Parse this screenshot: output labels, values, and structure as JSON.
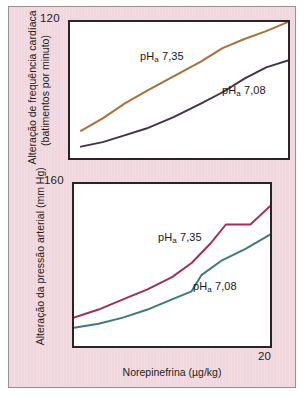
{
  "figure": {
    "background_color": "#efd7dd",
    "border_color": "#9b8d92",
    "panels": [
      {
        "id": "top",
        "y_tick_label": "120",
        "y_axis_title_line1": "Alteração de frequência cardíaca",
        "y_axis_title_line2": "(batimentos por minuto)",
        "series_label_upper": "pH",
        "series_label_upper_sub": "a",
        "series_label_upper_value": " 7,35",
        "series_label_lower": "pH",
        "series_label_lower_sub": "a",
        "series_label_lower_value": " 7,08"
      },
      {
        "id": "bottom",
        "y_tick_label": "160",
        "y_axis_title": "Alteração da pressão arterial (mm Hg)",
        "x_tick_label": "20",
        "x_axis_title": "Norepinefrina (µg/kg)",
        "series_label_upper": "pH",
        "series_label_upper_sub": "a",
        "series_label_upper_value": " 7,35",
        "series_label_lower": "pH",
        "series_label_lower_sub": "a",
        "series_label_lower_value": " 7,08"
      }
    ]
  },
  "chart_data": [
    {
      "type": "line",
      "title": "",
      "panel": "top",
      "xlabel": "Norepinefrina (µg/kg)",
      "ylabel": "Alteração de frequência cardíaca (batimentos por minuto)",
      "xlim": [
        0,
        20
      ],
      "ylim": [
        0,
        120
      ],
      "ytick_labels": [
        "120"
      ],
      "xtick_labels": [],
      "grid": false,
      "legend": "inline-annotations",
      "series": [
        {
          "name": "pH_a 7,35",
          "color": "#a8713a",
          "x": [
            1.0,
            3.0,
            5.0,
            7.0,
            9.5,
            12.0,
            14.0,
            16.0,
            18.0,
            20.0
          ],
          "y": [
            24,
            35,
            48,
            59,
            72,
            85,
            97,
            105,
            112,
            120
          ]
        },
        {
          "name": "pH_a 7,08",
          "color": "#443247",
          "x": [
            1.0,
            3.0,
            5.0,
            7.0,
            9.5,
            12.0,
            14.0,
            16.0,
            18.0,
            20.0
          ],
          "y": [
            10,
            14,
            20,
            26,
            36,
            48,
            58,
            70,
            80,
            86
          ]
        }
      ]
    },
    {
      "type": "line",
      "title": "",
      "panel": "bottom",
      "xlabel": "Norepinefrina (µg/kg)",
      "ylabel": "Alteração da pressão arterial (mm Hg)",
      "xlim": [
        0,
        20
      ],
      "ylim": [
        0,
        160
      ],
      "ytick_labels": [
        "160"
      ],
      "xtick_labels": [
        "20"
      ],
      "grid": false,
      "legend": "inline-annotations",
      "series": [
        {
          "name": "pH_a 7,35",
          "color": "#9e3055",
          "x": [
            0.0,
            2.5,
            5.0,
            7.5,
            10.0,
            12.0,
            14.0,
            15.5,
            18.0,
            20.0
          ],
          "y": [
            28,
            36,
            46,
            56,
            68,
            82,
            102,
            120,
            120,
            138
          ]
        },
        {
          "name": "pH_a 7,08",
          "color": "#3d7a7a",
          "x": [
            0.0,
            2.5,
            5.0,
            7.5,
            10.0,
            12.0,
            13.0,
            15.0,
            17.5,
            20.0
          ],
          "y": [
            18,
            22,
            28,
            36,
            46,
            54,
            70,
            84,
            96,
            110
          ]
        }
      ]
    }
  ]
}
